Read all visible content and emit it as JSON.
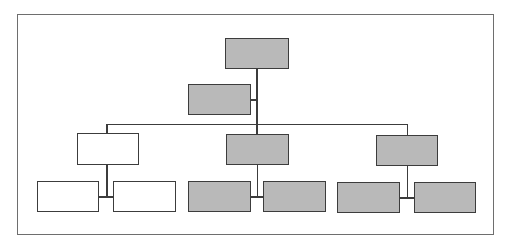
{
  "diagram": {
    "type": "org-chart",
    "colors": {
      "filled": "#b9b9b9",
      "empty": "#ffffff",
      "line": "#3c3c3c",
      "frame": "#6e6e6e"
    },
    "nodes": [
      {
        "id": "top",
        "fill": "gray",
        "label": ""
      },
      {
        "id": "assistant",
        "fill": "gray",
        "label": ""
      },
      {
        "id": "manager-left",
        "fill": "white",
        "label": ""
      },
      {
        "id": "manager-middle",
        "fill": "gray",
        "label": ""
      },
      {
        "id": "manager-right",
        "fill": "gray",
        "label": ""
      },
      {
        "id": "staff-left-1",
        "fill": "white",
        "label": ""
      },
      {
        "id": "staff-left-2",
        "fill": "white",
        "label": ""
      },
      {
        "id": "staff-middle-1",
        "fill": "gray",
        "label": ""
      },
      {
        "id": "staff-middle-2",
        "fill": "gray",
        "label": ""
      },
      {
        "id": "staff-right-1",
        "fill": "gray",
        "label": ""
      },
      {
        "id": "staff-right-2",
        "fill": "gray",
        "label": ""
      }
    ]
  }
}
